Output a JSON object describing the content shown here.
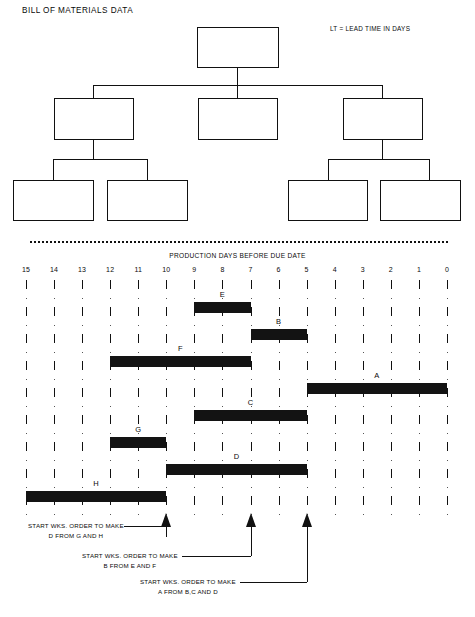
{
  "page": {
    "title": "BILL OF MATERIALS DATA",
    "legend_note": "LT = LEAD TIME IN DAYS"
  },
  "bom": {
    "nodes": [
      {
        "id": "A",
        "name": "ASSEMBLY A",
        "lt": "LT. = 5",
        "qty": "QTY. = 1",
        "x": 197,
        "y": 27,
        "w": 82,
        "h": 41
      },
      {
        "id": "B",
        "name": "SUB-ASSY B",
        "lt": "LT. = 2",
        "qty": "QTY. = 1",
        "x": 54,
        "y": 98,
        "w": 80,
        "h": 42
      },
      {
        "id": "C",
        "name": "COMPONENT C",
        "lt": "LT. = 4",
        "qty": "QTY. = 2",
        "x": 198,
        "y": 98,
        "w": 80,
        "h": 42
      },
      {
        "id": "D",
        "name": "SUB-ASSY D",
        "lt": "LT. = 3",
        "qty": "QTY. = 1",
        "x": 343,
        "y": 98,
        "w": 80,
        "h": 42
      },
      {
        "id": "E",
        "name": "COMPONENT E",
        "lt": "LT. = 2",
        "qty": "QTY. = 2",
        "x": 13,
        "y": 180,
        "w": 81,
        "h": 41
      },
      {
        "id": "F",
        "name": "COMPONENT F",
        "lt": "LT. = 3",
        "qty": "QTY. = 1",
        "x": 107,
        "y": 180,
        "w": 81,
        "h": 41
      },
      {
        "id": "G",
        "name": "COMPONENT G",
        "lt": "LT. = 2",
        "qty": "QTY. = 1",
        "x": 288,
        "y": 180,
        "w": 80,
        "h": 41
      },
      {
        "id": "H",
        "name": "COMPONENT H",
        "lt": "LT. = 3",
        "qty": "QTY. = 5",
        "x": 380,
        "y": 180,
        "w": 81,
        "h": 41
      }
    ]
  },
  "chart_data": {
    "type": "bar",
    "title": "PRODUCTION DAYS BEFORE DUE DATE",
    "xlabel": "PRODUCTION DAYS BEFORE DUE DATE",
    "ylabel": "",
    "orientation": "horizontal-gantt",
    "x_axis_reversed": true,
    "xlim": [
      15,
      0
    ],
    "grid": true,
    "tick_labels": [
      "15",
      "14",
      "13",
      "12",
      "11",
      "10",
      "9",
      "8",
      "7",
      "6",
      "5",
      "4",
      "3",
      "2",
      "1",
      "0"
    ],
    "tick_values": [
      15,
      14,
      13,
      12,
      11,
      10,
      9,
      8,
      7,
      6,
      5,
      4,
      3,
      2,
      1,
      0
    ],
    "categories": [
      "E",
      "B",
      "F",
      "A",
      "C",
      "G",
      "D",
      "H"
    ],
    "bars": [
      {
        "label": "E",
        "start_day": 9,
        "end_day": 7,
        "duration": 2,
        "row": 0
      },
      {
        "label": "B",
        "start_day": 7,
        "end_day": 5,
        "duration": 2,
        "row": 1
      },
      {
        "label": "F",
        "start_day": 12,
        "end_day": 7,
        "duration": 5,
        "row": 2
      },
      {
        "label": "A",
        "start_day": 5,
        "end_day": 0,
        "duration": 5,
        "row": 3
      },
      {
        "label": "C",
        "start_day": 9,
        "end_day": 5,
        "duration": 4,
        "row": 4
      },
      {
        "label": "G",
        "start_day": 12,
        "end_day": 10,
        "duration": 2,
        "row": 5
      },
      {
        "label": "D",
        "start_day": 10,
        "end_day": 5,
        "duration": 5,
        "row": 6
      },
      {
        "label": "H",
        "start_day": 15,
        "end_day": 10,
        "duration": 5,
        "row": 7
      }
    ],
    "markers": [
      {
        "day": 10,
        "line1": "START WKS. ORDER TO MAKE",
        "line2": "D FROM G AND H"
      },
      {
        "day": 7,
        "line1": "START WKS. ORDER TO MAKE",
        "line2": "B FROM E AND F"
      },
      {
        "day": 5,
        "line1": "START WKS. ORDER TO MAKE",
        "line2": "A FROM B,C AND D"
      }
    ]
  },
  "colors": {
    "bar": "#131313",
    "line": "#111111",
    "background": "#ffffff"
  }
}
